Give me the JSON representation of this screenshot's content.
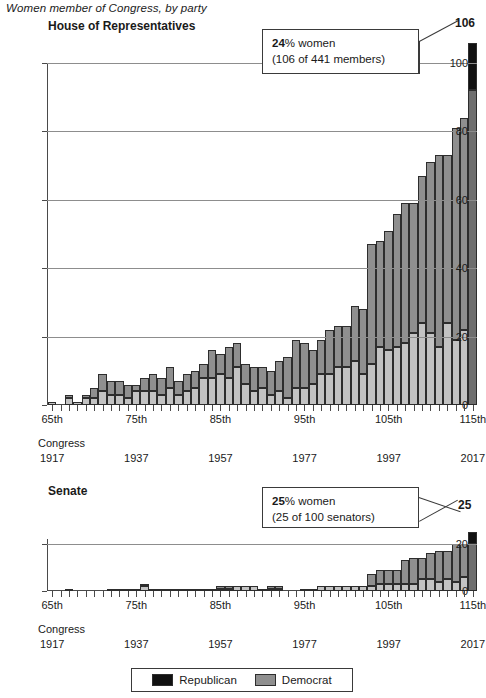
{
  "suptitle": "Women member of Congress, by party",
  "panels": {
    "house": {
      "title": "House of Representatives",
      "callout": {
        "bold": "24",
        "rest": "% women",
        "line2": "(106 of 441 members)"
      },
      "end_value_label": "106",
      "yticks": [
        0,
        20,
        40,
        60,
        80,
        100
      ],
      "ylim": [
        0,
        100
      ]
    },
    "senate": {
      "title": "Senate",
      "callout": {
        "bold": "25",
        "rest": "% women",
        "line2": "(25 of 100 senators)"
      },
      "end_value_label": "25",
      "yticks": [
        0,
        20
      ],
      "ylim": [
        0,
        22
      ]
    }
  },
  "legend": {
    "items": [
      {
        "label": "Republican",
        "color": "#111111"
      },
      {
        "label": "Democrat",
        "color": "#8f8f8f"
      }
    ]
  },
  "xaxis": {
    "congress_word": "Congress",
    "tick_labels": [
      "65th",
      "75th",
      "85th",
      "95th",
      "105th",
      "115th"
    ],
    "tick_indices": [
      0,
      10,
      20,
      30,
      40,
      50
    ],
    "year_labels": [
      "1917",
      "1937",
      "1957",
      "1977",
      "1997",
      "2017"
    ]
  },
  "chart_data": {
    "type": "bar",
    "title": "Women member of Congress, by party",
    "xlabel": "Congress",
    "ylabel": "",
    "stacked": true,
    "grid": true,
    "legend_position": "bottom",
    "categories": [
      "65th",
      "66th",
      "67th",
      "68th",
      "69th",
      "70th",
      "71st",
      "72nd",
      "73rd",
      "74th",
      "75th",
      "76th",
      "77th",
      "78th",
      "79th",
      "80th",
      "81st",
      "82nd",
      "83rd",
      "84th",
      "85th",
      "86th",
      "87th",
      "88th",
      "89th",
      "90th",
      "91st",
      "92nd",
      "93rd",
      "94th",
      "95th",
      "96th",
      "97th",
      "98th",
      "99th",
      "100th",
      "101st",
      "102nd",
      "103rd",
      "104th",
      "105th",
      "106th",
      "107th",
      "108th",
      "109th",
      "110th",
      "111th",
      "112th",
      "113th",
      "114th",
      "115th"
    ],
    "years": [
      1917,
      1919,
      1921,
      1923,
      1925,
      1927,
      1929,
      1931,
      1933,
      1935,
      1937,
      1939,
      1941,
      1943,
      1945,
      1947,
      1949,
      1951,
      1953,
      1955,
      1957,
      1959,
      1961,
      1963,
      1965,
      1967,
      1969,
      1971,
      1973,
      1975,
      1977,
      1979,
      1981,
      1983,
      1985,
      1987,
      1989,
      1991,
      1993,
      1995,
      1997,
      1999,
      2001,
      2003,
      2005,
      2007,
      2009,
      2011,
      2013,
      2015,
      2017
    ],
    "panels": [
      {
        "name": "House of Representatives",
        "ylim": [
          0,
          100
        ],
        "yticks": [
          0,
          20,
          40,
          60,
          80,
          100
        ],
        "series": [
          {
            "name": "Republican",
            "color": "#c3c3c3",
            "values": [
              1,
              0,
              2,
              1,
              2,
              2,
              4,
              3,
              3,
              2,
              4,
              4,
              4,
              3,
              5,
              3,
              4,
              5,
              8,
              8,
              9,
              8,
              11,
              6,
              4,
              5,
              3,
              4,
              2,
              5,
              5,
              6,
              9,
              9,
              11,
              11,
              13,
              9,
              12,
              17,
              16,
              17,
              18,
              21,
              24,
              21,
              17,
              24,
              19,
              22,
              21
            ]
          },
          {
            "name": "Democrat",
            "color": "#8f8f8f",
            "values": [
              0,
              0,
              1,
              0,
              1,
              3,
              5,
              4,
              4,
              4,
              2,
              4,
              5,
              5,
              6,
              4,
              5,
              5,
              4,
              8,
              6,
              9,
              7,
              6,
              7,
              6,
              7,
              9,
              12,
              14,
              13,
              10,
              10,
              13,
              12,
              12,
              16,
              19,
              35,
              31,
              35,
              39,
              41,
              38,
              43,
              50,
              56,
              49,
              62,
              62,
              64
            ]
          }
        ],
        "totals": [
          1,
          0,
          3,
          1,
          3,
          5,
          9,
          7,
          7,
          6,
          6,
          8,
          9,
          8,
          11,
          7,
          9,
          10,
          12,
          16,
          15,
          17,
          18,
          12,
          11,
          11,
          10,
          13,
          14,
          19,
          18,
          16,
          19,
          22,
          23,
          23,
          29,
          28,
          47,
          48,
          51,
          56,
          59,
          59,
          67,
          71,
          73,
          73,
          81,
          84,
          85
        ],
        "end_value": 106
      },
      {
        "name": "Senate",
        "ylim": [
          0,
          22
        ],
        "yticks": [
          0,
          20
        ],
        "series": [
          {
            "name": "Republican",
            "color": "#c3c3c3",
            "values": [
              0,
              0,
              1,
              0,
              0,
              0,
              0,
              0,
              1,
              1,
              1,
              2,
              1,
              1,
              1,
              1,
              1,
              1,
              0,
              1,
              1,
              1,
              2,
              2,
              2,
              1,
              1,
              1,
              0,
              0,
              0,
              1,
              2,
              2,
              2,
              2,
              2,
              2,
              2,
              3,
              3,
              3,
              3,
              3,
              5,
              5,
              4,
              5,
              4,
              6,
              5
            ]
          },
          {
            "name": "Democrat",
            "color": "#8f8f8f",
            "values": [
              0,
              0,
              0,
              0,
              0,
              0,
              0,
              1,
              0,
              0,
              0,
              1,
              0,
              0,
              0,
              0,
              0,
              0,
              1,
              0,
              1,
              1,
              0,
              0,
              0,
              0,
              1,
              1,
              0,
              0,
              1,
              0,
              0,
              0,
              0,
              0,
              0,
              0,
              5,
              6,
              6,
              6,
              10,
              11,
              9,
              11,
              13,
              12,
              16,
              14,
              16
            ]
          }
        ],
        "totals": [
          0,
          0,
          1,
          0,
          0,
          0,
          0,
          1,
          1,
          1,
          1,
          3,
          1,
          1,
          1,
          1,
          1,
          1,
          1,
          1,
          2,
          2,
          2,
          2,
          2,
          1,
          2,
          2,
          0,
          0,
          1,
          1,
          2,
          2,
          2,
          2,
          2,
          2,
          7,
          9,
          9,
          9,
          13,
          14,
          14,
          16,
          17,
          17,
          20,
          20,
          21
        ],
        "end_value": 25
      }
    ]
  }
}
